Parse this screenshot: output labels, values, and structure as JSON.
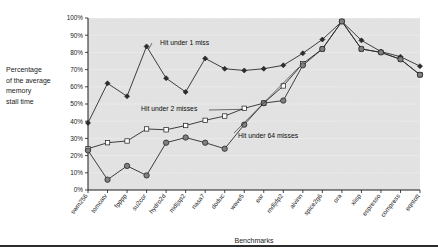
{
  "chart_data": {
    "type": "line",
    "title": "",
    "xlabel": "Benchmarks",
    "ylabel": "Percentage of the average memory stall time",
    "ylabel_lines": [
      "Percentage",
      "of the average",
      "memory",
      "stall time"
    ],
    "ylim": [
      0,
      100
    ],
    "yticks": [
      0,
      10,
      20,
      30,
      40,
      50,
      60,
      70,
      80,
      90,
      100
    ],
    "ytick_labels": [
      "0%",
      "10%",
      "20%",
      "30%",
      "40%",
      "50%",
      "60%",
      "70%",
      "80%",
      "90%",
      "100%"
    ],
    "grid": true,
    "grid_axis": "y",
    "legend_position": "inline-annotations",
    "plot_background": "#e2e2e2",
    "categories": [
      "swm256",
      "tomcatv",
      "fpppp",
      "su2cor",
      "hydro2d",
      "mdljsp2",
      "nasa7",
      "doduc",
      "wave5",
      "ear",
      "mdljdp2",
      "alvinn",
      "spice2g6",
      "ora",
      "xlisp",
      "espresso",
      "compress",
      "eqntott"
    ],
    "series": [
      {
        "name": "Hit under 1 miss",
        "marker": "diamond",
        "color": "#2d2d2d",
        "values": [
          39,
          62,
          54.5,
          83.5,
          65,
          57,
          76.5,
          70.5,
          69.5,
          70.5,
          72.5,
          79.5,
          87.5,
          98,
          87,
          80.5,
          77.5,
          72
        ]
      },
      {
        "name": "Hit under 2 misses",
        "marker": "square",
        "color": "#ffffff",
        "values": [
          24,
          27.5,
          28.5,
          35.5,
          35,
          37.5,
          40.5,
          43,
          47.5,
          50.5,
          60.5,
          73.5,
          82,
          98,
          82,
          80,
          76,
          67
        ]
      },
      {
        "name": "Hit under 64 misses",
        "marker": "circle",
        "color": "#808080",
        "values": [
          23,
          6,
          14,
          8.5,
          27.5,
          30.5,
          27.5,
          24,
          38,
          50.5,
          52,
          72.5,
          82,
          98,
          82,
          80,
          76,
          67
        ]
      }
    ],
    "annotations": [
      {
        "text": "Hit under 1 miss",
        "series": "Hit under 1 miss"
      },
      {
        "text": "Hit under 2 misses",
        "series": "Hit under 2 misses"
      },
      {
        "text": "Hit under 64 misses",
        "series": "Hit under 64 misses"
      }
    ]
  }
}
